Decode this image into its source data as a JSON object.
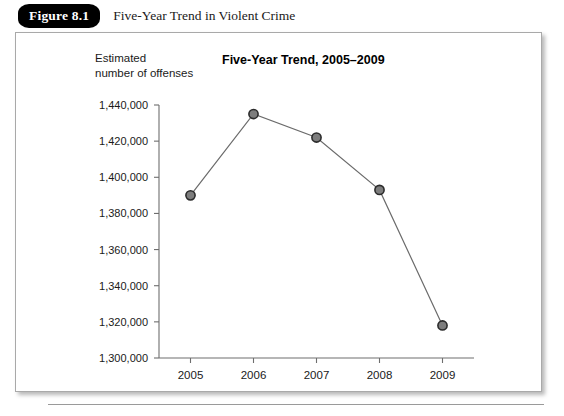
{
  "figure": {
    "number_label": "Figure 8.1",
    "caption": "Five-Year Trend in Violent Crime"
  },
  "chart_data": {
    "type": "line",
    "title": "Five-Year Trend, 2005–2009",
    "xlabel": "",
    "ylabel": "Estimated\nnumber of offenses",
    "categories": [
      "2005",
      "2006",
      "2007",
      "2008",
      "2009"
    ],
    "values": [
      1390000,
      1435000,
      1422000,
      1393000,
      1318000
    ],
    "value_labels": [
      "1,390,000",
      "1,435,000",
      "1,422,000",
      "1,393,000",
      "1,318,000"
    ],
    "ylim": [
      1300000,
      1440000
    ],
    "ytick_values": [
      1300000,
      1320000,
      1340000,
      1360000,
      1380000,
      1400000,
      1420000,
      1440000
    ],
    "ytick_labels": [
      "1,300,000",
      "1,320,000",
      "1,340,000",
      "1,360,000",
      "1,380,000",
      "1,400,000",
      "1,420,000",
      "1,440,000"
    ],
    "grid": false,
    "legend": false,
    "series_name": "Estimated number of offenses",
    "marker": "circle",
    "line_color": "#6b6b6b",
    "marker_fill": "#7d7d7d",
    "marker_stroke": "#2b2b2b"
  }
}
